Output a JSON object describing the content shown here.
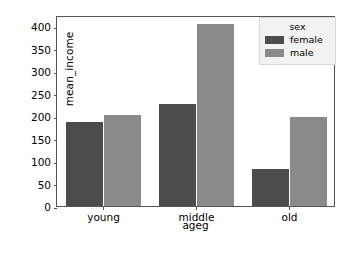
{
  "chart_data": {
    "type": "bar",
    "title": "",
    "xlabel": "ageg",
    "ylabel": "mean_income",
    "categories": [
      "young",
      "middle",
      "old"
    ],
    "series": [
      {
        "name": "female",
        "color": "#4c4c4c",
        "values": [
          188,
          226,
          82
        ]
      },
      {
        "name": "male",
        "color": "#8a8a8a",
        "values": [
          202,
          405,
          197
        ]
      }
    ],
    "legend": {
      "title": "sex",
      "position": "upper right",
      "entries": [
        "female",
        "male"
      ]
    },
    "ylim": [
      0,
      425
    ],
    "yticks": [
      0,
      50,
      100,
      150,
      200,
      250,
      300,
      350,
      400
    ],
    "ytick_labels": [
      "0",
      "50",
      "100",
      "150",
      "200",
      "250",
      "300",
      "350",
      "400"
    ],
    "xtick_labels": [
      "young",
      "middle",
      "old"
    ],
    "grid": false
  }
}
